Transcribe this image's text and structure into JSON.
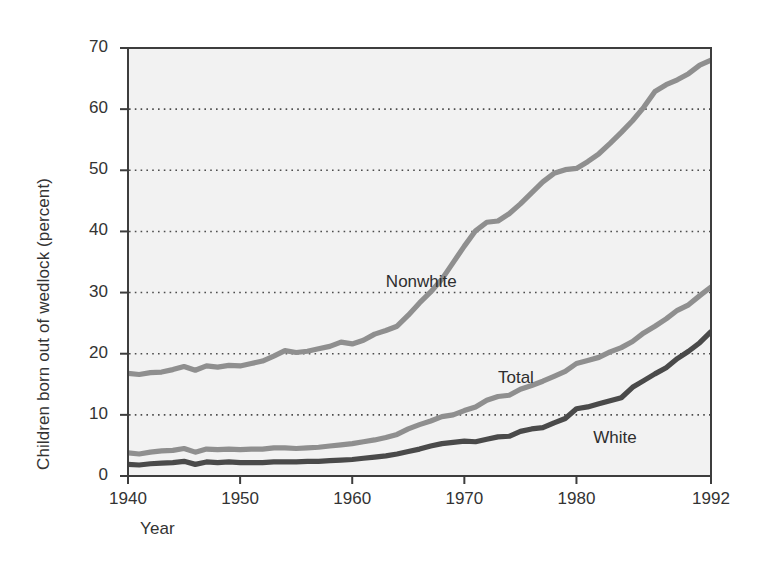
{
  "chart_data": {
    "type": "line",
    "title": "",
    "subtitle": "",
    "xlabel": "Year",
    "ylabel": "Children born out of wedlock (percent)",
    "xlim": [
      1940,
      1992
    ],
    "ylim": [
      0,
      70
    ],
    "xticks": [
      "1940",
      "1950",
      "1960",
      "1970",
      "1980",
      "1992"
    ],
    "xtick_values": [
      1940,
      1950,
      1960,
      1970,
      1980,
      1992
    ],
    "yticks": [
      "0",
      "10",
      "20",
      "30",
      "40",
      "50",
      "60",
      "70"
    ],
    "ytick_values": [
      0,
      10,
      20,
      30,
      40,
      50,
      60,
      70
    ],
    "grid": "horizontal-dotted",
    "legend_position": "inline-annotations",
    "plot_background": "#f2f2f2",
    "frame_color": "#3d3d3d",
    "gridline_color": "#4d4d4d",
    "x": [
      1940,
      1941,
      1942,
      1943,
      1944,
      1945,
      1946,
      1947,
      1948,
      1949,
      1950,
      1951,
      1952,
      1953,
      1954,
      1955,
      1956,
      1957,
      1958,
      1959,
      1960,
      1961,
      1962,
      1963,
      1964,
      1965,
      1966,
      1967,
      1968,
      1969,
      1970,
      1971,
      1972,
      1973,
      1974,
      1975,
      1976,
      1977,
      1978,
      1979,
      1980,
      1981,
      1982,
      1983,
      1984,
      1985,
      1986,
      1987,
      1988,
      1989,
      1990,
      1991,
      1992
    ],
    "series": [
      {
        "name": "Nonwhite",
        "color": "#8f8f8f",
        "label_x": 1963,
        "label_y": 31.5,
        "values": [
          16.8,
          16.6,
          16.9,
          17.0,
          17.4,
          17.9,
          17.3,
          18.0,
          17.8,
          18.1,
          18.0,
          18.4,
          18.8,
          19.6,
          20.5,
          20.2,
          20.4,
          20.8,
          21.2,
          21.9,
          21.6,
          22.2,
          23.2,
          23.8,
          24.5,
          26.3,
          28.3,
          30.1,
          32.2,
          34.9,
          37.6,
          40.1,
          41.5,
          41.7,
          42.9,
          44.5,
          46.3,
          48.1,
          49.5,
          50.1,
          50.3,
          51.4,
          52.7,
          54.4,
          56.2,
          58.1,
          60.3,
          62.9,
          64.0,
          64.8,
          65.8,
          67.2,
          68.0
        ]
      },
      {
        "name": "Total",
        "color": "#8f8f8f",
        "label_x": 1973,
        "label_y": 15.8,
        "values": [
          3.8,
          3.6,
          3.9,
          4.1,
          4.2,
          4.5,
          3.9,
          4.4,
          4.3,
          4.4,
          4.3,
          4.4,
          4.4,
          4.6,
          4.6,
          4.5,
          4.6,
          4.7,
          4.9,
          5.1,
          5.3,
          5.6,
          5.9,
          6.3,
          6.8,
          7.7,
          8.4,
          9.0,
          9.7,
          10.0,
          10.7,
          11.3,
          12.4,
          13.0,
          13.2,
          14.2,
          14.8,
          15.5,
          16.3,
          17.1,
          18.4,
          18.9,
          19.4,
          20.3,
          21.0,
          22.0,
          23.4,
          24.5,
          25.7,
          27.1,
          28.0,
          29.5,
          30.9
        ]
      },
      {
        "name": "White",
        "color": "#4a4a4a",
        "label_x": 1981.5,
        "label_y": 6.0,
        "values": [
          1.9,
          1.8,
          2.0,
          2.1,
          2.2,
          2.4,
          1.9,
          2.3,
          2.2,
          2.3,
          2.2,
          2.2,
          2.2,
          2.3,
          2.3,
          2.3,
          2.4,
          2.4,
          2.5,
          2.6,
          2.7,
          2.9,
          3.1,
          3.3,
          3.6,
          4.0,
          4.4,
          4.9,
          5.3,
          5.5,
          5.7,
          5.6,
          6.0,
          6.4,
          6.5,
          7.3,
          7.7,
          7.9,
          8.7,
          9.4,
          11.0,
          11.3,
          11.8,
          12.3,
          12.8,
          14.5,
          15.6,
          16.7,
          17.7,
          19.2,
          20.4,
          21.8,
          23.6
        ]
      }
    ]
  }
}
